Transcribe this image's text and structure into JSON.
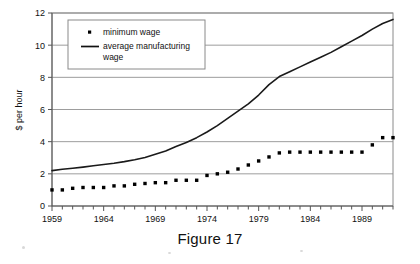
{
  "figure": {
    "caption": "Figure 17"
  },
  "chart_data": {
    "type": "scatter",
    "title": "",
    "xlabel": "",
    "ylabel": "$ per hour",
    "xlim": [
      1959,
      1992
    ],
    "ylim": [
      0,
      12
    ],
    "ytick_values": [
      0,
      2,
      4,
      6,
      8,
      10,
      12
    ],
    "ytick_labels": [
      "0",
      "2",
      "4",
      "6",
      "8",
      "10",
      "12"
    ],
    "xtick_values": [
      1959,
      1964,
      1969,
      1974,
      1979,
      1984,
      1989
    ],
    "xtick_labels": [
      "1959",
      "1964",
      "1969",
      "1974",
      "1979",
      "1984",
      "1989"
    ],
    "xtick_minor_step": 1,
    "grid": "horizontal",
    "legend_position": "top-left-inside",
    "x": [
      1959,
      1960,
      1961,
      1962,
      1963,
      1964,
      1965,
      1966,
      1967,
      1968,
      1969,
      1970,
      1971,
      1972,
      1973,
      1974,
      1975,
      1976,
      1977,
      1978,
      1979,
      1980,
      1981,
      1982,
      1983,
      1984,
      1985,
      1986,
      1987,
      1988,
      1989,
      1990,
      1991,
      1992
    ],
    "series": [
      {
        "name": "minimum wage",
        "marker": "square",
        "style": "scatter",
        "color": "#000000",
        "values": [
          1.0,
          1.0,
          1.1,
          1.15,
          1.15,
          1.15,
          1.25,
          1.25,
          1.35,
          1.4,
          1.45,
          1.45,
          1.6,
          1.6,
          1.6,
          1.9,
          2.0,
          2.1,
          2.3,
          2.55,
          2.8,
          3.05,
          3.3,
          3.35,
          3.35,
          3.35,
          3.35,
          3.35,
          3.35,
          3.35,
          3.35,
          3.8,
          4.25,
          4.25
        ]
      },
      {
        "name": "average manufacturing wage",
        "marker": "none",
        "style": "line",
        "color": "#1a1a1a",
        "values": [
          2.2,
          2.28,
          2.35,
          2.42,
          2.5,
          2.58,
          2.66,
          2.76,
          2.88,
          3.02,
          3.22,
          3.42,
          3.7,
          3.95,
          4.25,
          4.6,
          5.0,
          5.45,
          5.9,
          6.35,
          6.9,
          7.55,
          8.05,
          8.35,
          8.65,
          8.95,
          9.25,
          9.55,
          9.9,
          10.25,
          10.6,
          11.0,
          11.35,
          11.6
        ]
      }
    ]
  },
  "legend": {
    "entries": [
      {
        "label": "minimum wage",
        "marker": "square-marker"
      },
      {
        "label": "average manufacturing wage",
        "marker": "line-marker"
      }
    ]
  }
}
